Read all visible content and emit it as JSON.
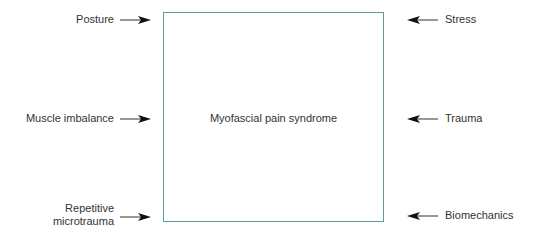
{
  "diagram": {
    "center_label": "Myofascial pain syndrome",
    "box_color": "#5a9a9a",
    "left_factors": [
      {
        "label": "Posture"
      },
      {
        "label": "Muscle imbalance"
      },
      {
        "label_line1": "Repetitive",
        "label_line2": "microtrauma"
      }
    ],
    "right_factors": [
      {
        "label": "Stress"
      },
      {
        "label": "Trauma"
      },
      {
        "label": "Biomechanics"
      }
    ]
  }
}
